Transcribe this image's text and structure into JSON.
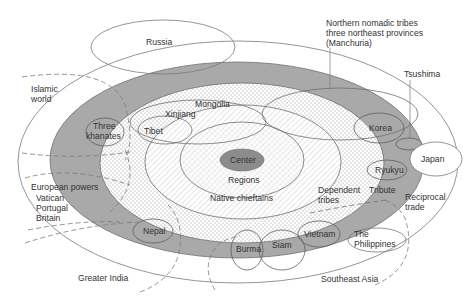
{
  "diagram": {
    "type": "concentric-zones",
    "colors": {
      "background": "#ffffff",
      "tribute_ring": "#a9a9a9",
      "center_fill": "#8c8c8c",
      "line": "#6e6e6e",
      "text": "#333333"
    },
    "zones": {
      "center": "Center",
      "regions": "Regions",
      "native_chieftains": "Native chieftains",
      "dependent_tribes_1": "Dependent",
      "dependent_tribes_2": "tribes",
      "tribute": "Tribute",
      "reciprocal_trade_1": "Reciprocal",
      "reciprocal_trade_2": "trade"
    },
    "polities": {
      "russia": "Russia",
      "islamic_world_1": "Islamic",
      "islamic_world_2": "world",
      "three_khanates_1": "Three",
      "three_khanates_2": "khanates",
      "tibet": "Tibet",
      "xinjiang": "Xinjiang",
      "mongolia": "Mongolia",
      "northern_1": "Northern nomadic tribes",
      "northern_2": "three northeast provinces",
      "northern_3": "(Manchuria)",
      "tsushima": "Tsushima",
      "korea": "Korea",
      "japan": "Japan",
      "ryukyu": "Ryukyu",
      "european_powers": "European powers",
      "vatican": "Vatican",
      "portugal": "Portugal",
      "britain": "Britain",
      "nepal": "Nepal",
      "burma": "Burma",
      "siam": "Siam",
      "vietnam": "Vietnam",
      "philippines_1": "The",
      "philippines_2": "Philippines",
      "greater_india": "Greater India",
      "southeast_asia": "Southeast Asia"
    }
  }
}
